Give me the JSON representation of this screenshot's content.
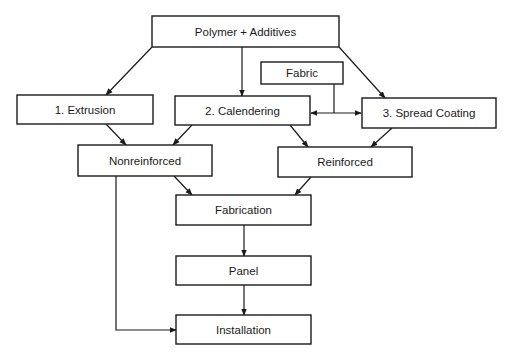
{
  "diagram": {
    "type": "flowchart",
    "nodes": {
      "polymer": {
        "label": "Polymer + Additives"
      },
      "extrusion": {
        "label": "1. Extrusion"
      },
      "calendering": {
        "label": "2. Calendering"
      },
      "fabric": {
        "label": "Fabric"
      },
      "spread_coating": {
        "label": "3. Spread Coating"
      },
      "nonreinforced": {
        "label": "Nonreinforced"
      },
      "reinforced": {
        "label": "Reinforced"
      },
      "fabrication": {
        "label": "Fabrication"
      },
      "panel": {
        "label": "Panel"
      },
      "installation": {
        "label": "Installation"
      }
    },
    "edges": [
      {
        "from": "Polymer + Additives",
        "to": "1. Extrusion"
      },
      {
        "from": "Polymer + Additives",
        "to": "2. Calendering"
      },
      {
        "from": "Polymer + Additives",
        "to": "3. Spread Coating"
      },
      {
        "from": "Fabric",
        "to": "2. Calendering"
      },
      {
        "from": "Fabric",
        "to": "3. Spread Coating"
      },
      {
        "from": "1. Extrusion",
        "to": "Nonreinforced"
      },
      {
        "from": "2. Calendering",
        "to": "Nonreinforced"
      },
      {
        "from": "2. Calendering",
        "to": "Reinforced"
      },
      {
        "from": "3. Spread Coating",
        "to": "Reinforced"
      },
      {
        "from": "Nonreinforced",
        "to": "Fabrication"
      },
      {
        "from": "Reinforced",
        "to": "Fabrication"
      },
      {
        "from": "Fabrication",
        "to": "Panel"
      },
      {
        "from": "Panel",
        "to": "Installation"
      },
      {
        "from": "Nonreinforced",
        "to": "Installation"
      }
    ],
    "colors": {
      "stroke": "#1a1a1a",
      "fill": "#ffffff",
      "text": "#1a1a1a"
    }
  }
}
